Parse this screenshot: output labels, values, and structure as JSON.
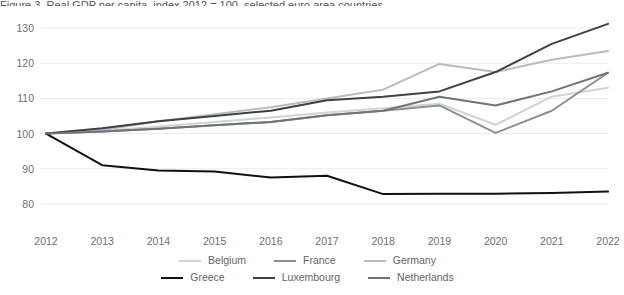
{
  "partial_title": "Figure 3. Real GDP per capita, index 2012 = 100, selected euro area countries",
  "axes": {
    "ytick_labels": [
      "130",
      "120",
      "110",
      "100",
      "90",
      "80"
    ],
    "ytick_values": [
      130,
      120,
      110,
      100,
      90,
      80
    ],
    "xtick_labels": [
      "2012",
      "2013",
      "2014",
      "2015",
      "2016",
      "2017",
      "2018",
      "2019",
      "2020",
      "2021",
      "2022"
    ]
  },
  "legend": {
    "row1": [
      {
        "label": "Belgium",
        "color": "#d2d3d4"
      },
      {
        "label": "France",
        "color": "#8b9096"
      },
      {
        "label": "Germany",
        "color": "#b9bbbd"
      }
    ],
    "row2": [
      {
        "label": "Greece",
        "color": "#111111"
      },
      {
        "label": "Luxembourg",
        "color": "#3c4146"
      },
      {
        "label": "Netherlands",
        "color": "#6e7479"
      }
    ]
  },
  "chart_data": {
    "type": "line",
    "title": "Real GDP per capita, index 2012 = 100, selected euro area countries",
    "xlabel": "",
    "ylabel": "",
    "x": [
      2012,
      2013,
      2014,
      2015,
      2016,
      2017,
      2018,
      2019,
      2020,
      2021,
      2022
    ],
    "ylim": [
      76,
      134
    ],
    "yticks": [
      80,
      90,
      100,
      110,
      120,
      130
    ],
    "grid": true,
    "legend_position": "bottom",
    "series": [
      {
        "name": "Belgium",
        "color": "#d2d3d4",
        "values": [
          100,
          100.7,
          102.0,
          103.3,
          104.6,
          106.0,
          107.2,
          108.5,
          102.5,
          110.5,
          113.0
        ]
      },
      {
        "name": "France",
        "color": "#8b9096",
        "values": [
          100,
          100.6,
          101.4,
          102.4,
          103.3,
          105.2,
          106.5,
          108.0,
          100.2,
          106.5,
          117.3
        ]
      },
      {
        "name": "Germany",
        "color": "#b9bbbd",
        "values": [
          100,
          101.0,
          103.5,
          105.5,
          107.5,
          110.0,
          112.5,
          119.8,
          117.5,
          121.0,
          123.5
        ]
      },
      {
        "name": "Greece",
        "color": "#111111",
        "values": [
          100,
          91.0,
          89.5,
          89.2,
          87.5,
          88.0,
          82.8,
          82.9,
          82.9,
          83.1,
          83.5
        ]
      },
      {
        "name": "Luxembourg",
        "color": "#3c4146",
        "values": [
          100,
          101.5,
          103.5,
          105.0,
          106.5,
          109.5,
          110.5,
          112.0,
          117.5,
          125.5,
          131.2
        ]
      },
      {
        "name": "Netherlands",
        "color": "#6e7479",
        "values": [
          100,
          100.6,
          101.4,
          102.4,
          103.3,
          105.2,
          106.5,
          110.5,
          108.0,
          112.0,
          117.3
        ]
      }
    ]
  }
}
